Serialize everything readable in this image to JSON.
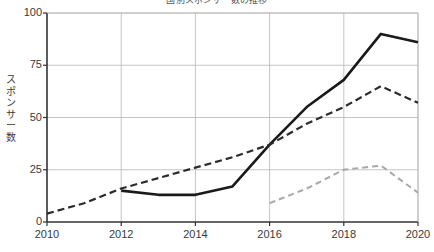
{
  "chart_data": {
    "type": "line",
    "title": "国別スポンサー数の推移",
    "xlabel": "",
    "ylabel": "スポンサー数",
    "x": [
      2010,
      2011,
      2012,
      2013,
      2014,
      2015,
      2016,
      2017,
      2018,
      2019,
      2020
    ],
    "xlim": [
      2010,
      2020
    ],
    "ylim": [
      0,
      100
    ],
    "xticks": [
      "2010",
      "2012",
      "2014",
      "2016",
      "2018",
      "2020"
    ],
    "yticks": [
      "0",
      "25",
      "50",
      "75",
      "100"
    ],
    "grid": "both",
    "legend": "none",
    "series": [
      {
        "name": "solid-series",
        "style": "solid",
        "color": "#1a1a1a",
        "width": 2.6,
        "x": [
          2012,
          2013,
          2014,
          2015,
          2016,
          2017,
          2018,
          2019,
          2020
        ],
        "values": [
          15,
          13,
          13,
          17,
          37,
          55,
          68,
          90,
          86
        ]
      },
      {
        "name": "dark-dashed-series",
        "style": "dashed",
        "color": "#2b2b2b",
        "width": 2.2,
        "x": [
          2010,
          2011,
          2012,
          2013,
          2014,
          2015,
          2016,
          2017,
          2018,
          2019,
          2020
        ],
        "values": [
          4,
          9,
          16,
          21,
          26,
          31,
          37,
          47,
          55,
          65,
          57
        ]
      },
      {
        "name": "light-dashed-series",
        "style": "dashed",
        "color": "#a8a8a8",
        "width": 2.0,
        "x": [
          2016,
          2017,
          2018,
          2019,
          2020
        ],
        "values": [
          9,
          16,
          25,
          27,
          14
        ]
      }
    ]
  },
  "axis": {
    "y_label_chars": [
      "ス",
      "ポ",
      "ン",
      "サ",
      "ー",
      "数"
    ]
  }
}
